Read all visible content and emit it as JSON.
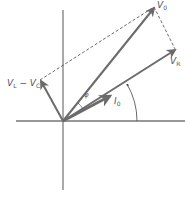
{
  "diagram": {
    "colors": {
      "axis": "#333333",
      "phasor": "#6b6b6b",
      "dashed": "#444444",
      "label": "#555555",
      "background": "#ffffff"
    },
    "labels": {
      "v0": {
        "main": "V",
        "sub": "0"
      },
      "vr": {
        "main": "V",
        "sub": "R"
      },
      "vlvc": {
        "main1": "V",
        "sub1": "L",
        "minus": " − ",
        "main2": "V",
        "sub2": "C"
      },
      "i0": {
        "main": "I",
        "sub": "0"
      },
      "phi": "φ"
    }
  }
}
